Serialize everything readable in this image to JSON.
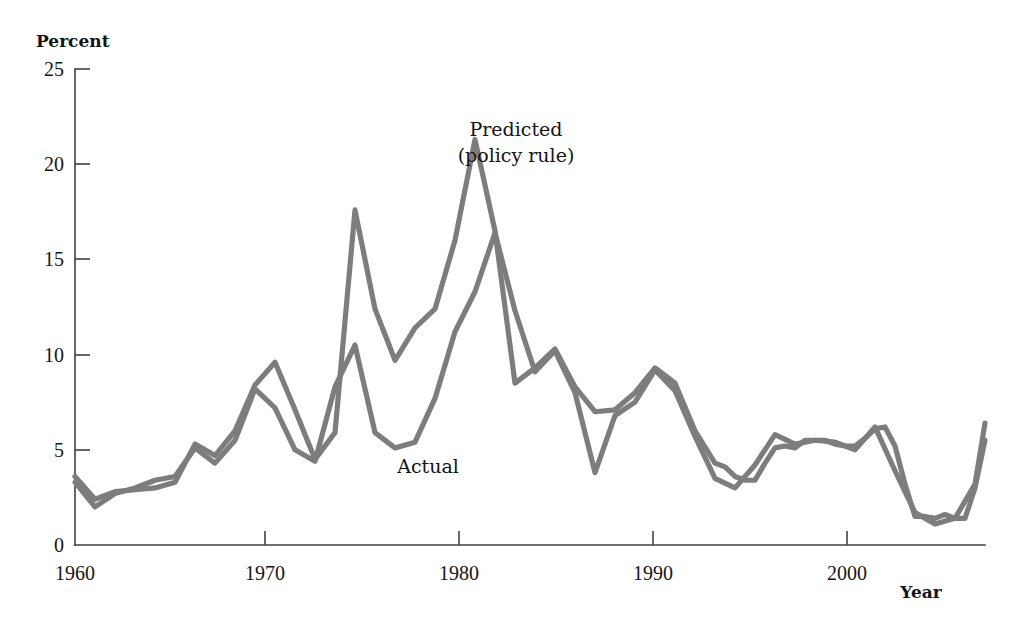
{
  "figure": {
    "background_color": "#ffffff",
    "y_axis_title": "Percent",
    "x_axis_title": "Year"
  },
  "annotations": {
    "predicted_line1": "Predicted",
    "predicted_line2": "(policy rule)",
    "actual": "Actual"
  },
  "axis": {
    "y_ticks": [
      "0",
      "5",
      "10",
      "15",
      "20",
      "25"
    ],
    "x_ticks": [
      "1960",
      "1970",
      "1980",
      "1990",
      "2000"
    ]
  },
  "chart_data": {
    "type": "line",
    "title": "",
    "subtitle": "",
    "xlabel": "Year",
    "ylabel": "Percent",
    "xlim": [
      1960,
      2005.5
    ],
    "ylim": [
      0,
      25
    ],
    "yticks": [
      0,
      5,
      10,
      15,
      20,
      25
    ],
    "xticks": [
      1960,
      1970,
      1980,
      1990,
      2000
    ],
    "grid": false,
    "legend": "inline-annotations",
    "line_color": "#7d7d7d",
    "series": [
      {
        "name": "Predicted (policy rule)",
        "label_position": "above-1980-peak",
        "x": [
          1960,
          1961,
          1962,
          1963,
          1964,
          1965,
          1966,
          1967,
          1968,
          1969,
          1970,
          1971,
          1972,
          1973,
          1974,
          1975,
          1976,
          1977,
          1978,
          1979,
          1980,
          1981,
          1982,
          1983,
          1984,
          1985,
          1986,
          1987,
          1988,
          1989,
          1990,
          1991,
          1992,
          1992.5,
          1993,
          1993.5,
          1994,
          1994.5,
          1995,
          1995.5,
          1996,
          1996.5,
          1997,
          1997.5,
          1998,
          1998.5,
          1999,
          1999.5,
          2000,
          2000.5,
          2001,
          2001.5,
          2002,
          2002.5,
          2003,
          2003.5,
          2004,
          2004.5,
          2005,
          2005.5
        ],
        "values": [
          3.6,
          2.4,
          2.8,
          2.9,
          3.0,
          3.3,
          5.3,
          4.7,
          6.0,
          8.4,
          9.6,
          7.1,
          4.5,
          5.9,
          17.6,
          12.4,
          9.7,
          11.4,
          12.4,
          16.0,
          21.3,
          16.5,
          8.5,
          9.3,
          10.3,
          8.3,
          7.0,
          7.1,
          8.0,
          9.3,
          8.5,
          6.0,
          4.3,
          4.1,
          3.6,
          3.4,
          3.4,
          4.3,
          5.1,
          5.2,
          5.1,
          5.5,
          5.5,
          5.5,
          5.3,
          5.2,
          5.2,
          5.6,
          6.1,
          6.2,
          5.2,
          3.2,
          1.5,
          1.5,
          1.4,
          1.6,
          1.4,
          1.4,
          3.0,
          5.5
        ]
      },
      {
        "name": "Actual",
        "label_position": "below-1976-trough",
        "x": [
          1960,
          1961,
          1962,
          1963,
          1964,
          1965,
          1966,
          1967,
          1968,
          1969,
          1970,
          1971,
          1972,
          1973,
          1974,
          1975,
          1976,
          1977,
          1978,
          1979,
          1980,
          1981,
          1982,
          1983,
          1984,
          1985,
          1986,
          1987,
          1988,
          1989,
          1990,
          1991,
          1992,
          1993,
          1994,
          1995,
          1996,
          1997,
          1998,
          1999,
          2000,
          2001,
          2002,
          2003,
          2004,
          2005,
          2005.5
        ],
        "values": [
          3.3,
          2.0,
          2.7,
          3.0,
          3.4,
          3.6,
          5.1,
          4.3,
          5.5,
          8.2,
          7.2,
          5.0,
          4.4,
          8.3,
          10.5,
          5.9,
          5.1,
          5.4,
          7.7,
          11.2,
          13.3,
          16.4,
          12.3,
          9.1,
          10.2,
          8.0,
          3.8,
          6.8,
          7.5,
          9.2,
          8.1,
          5.7,
          3.5,
          3.0,
          4.2,
          5.8,
          5.3,
          5.5,
          5.4,
          5.0,
          6.2,
          3.9,
          1.7,
          1.1,
          1.4,
          3.2,
          6.4
        ]
      }
    ],
    "notable_points": [
      {
        "series": "Predicted (policy rule)",
        "year": 1974,
        "value": 17.6,
        "note": "first major peak"
      },
      {
        "series": "Predicted (policy rule)",
        "year": 1980,
        "value": 21.3,
        "note": "maximum of chart"
      },
      {
        "series": "Actual",
        "year": 1981,
        "value": 16.4,
        "note": "actual maximum"
      },
      {
        "series": "Actual",
        "year": 1986,
        "value": 3.8,
        "note": "mid-1980s trough"
      },
      {
        "series": "Actual",
        "year": 2003,
        "value": 1.1,
        "note": "early-2000s trough"
      }
    ]
  }
}
